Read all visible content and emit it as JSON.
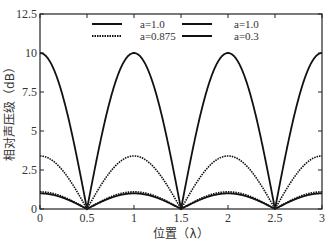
{
  "chart_data": {
    "type": "line",
    "title": "",
    "xlabel": "位置（λ）",
    "ylabel": "相对声压级（dB）",
    "xlim": [
      0,
      3
    ],
    "ylim": [
      0,
      12.5
    ],
    "x_ticks": [
      "0",
      "0.5",
      "1",
      "1.5",
      "2",
      "2.5",
      "3"
    ],
    "y_ticks": [
      "0",
      "2.5",
      "5",
      "7.5",
      "10",
      "12.5"
    ],
    "grid": false,
    "legend_position": "top-center",
    "legend": [
      {
        "label": "a=1.0",
        "style": "solid"
      },
      {
        "label": "a=0.875",
        "style": "dotted"
      },
      {
        "label": "a=1.0",
        "style": "solid"
      },
      {
        "label": "a=0.3",
        "style": "solid"
      }
    ],
    "series": [
      {
        "name": "a=1.0",
        "style": "solid",
        "peak": 10.0,
        "x": [
          0,
          0.5,
          1,
          1.5,
          2,
          2.5,
          3
        ],
        "values": [
          10.0,
          0,
          10.0,
          0,
          10.0,
          0,
          10.0
        ]
      },
      {
        "name": "a=0.875",
        "style": "dotted",
        "peak": 3.4,
        "x": [
          0,
          0.5,
          1,
          1.5,
          2,
          2.5,
          3
        ],
        "values": [
          3.4,
          0,
          3.4,
          0,
          3.4,
          0,
          3.4
        ]
      },
      {
        "name": "a=1.0 (2)",
        "style": "dotted",
        "peak": 1.1,
        "x": [
          0,
          0.5,
          1,
          1.5,
          2,
          2.5,
          3
        ],
        "values": [
          1.1,
          0,
          1.1,
          0,
          1.1,
          0,
          1.1
        ]
      },
      {
        "name": "a=0.3",
        "style": "solid",
        "peak": 1.0,
        "x": [
          0,
          0.5,
          1,
          1.5,
          2,
          2.5,
          3
        ],
        "values": [
          1.0,
          0,
          1.0,
          0,
          1.0,
          0,
          1.0
        ]
      }
    ],
    "colors": {
      "line": "#111111",
      "axis": "#222222",
      "text": "#333333"
    }
  }
}
